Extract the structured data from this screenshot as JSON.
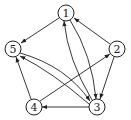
{
  "diagram": {
    "type": "directed-graph",
    "nodes": [
      {
        "id": "1",
        "label": "1",
        "x": 66,
        "y": 13
      },
      {
        "id": "2",
        "label": "2",
        "x": 117,
        "y": 49
      },
      {
        "id": "3",
        "label": "3",
        "x": 97,
        "y": 107
      },
      {
        "id": "4",
        "label": "4",
        "x": 34,
        "y": 107
      },
      {
        "id": "5",
        "label": "5",
        "x": 13,
        "y": 49
      }
    ],
    "edges": [
      {
        "from": "1",
        "to": "5"
      },
      {
        "from": "2",
        "to": "1"
      },
      {
        "from": "2",
        "to": "3"
      },
      {
        "from": "3",
        "to": "1"
      },
      {
        "from": "1",
        "to": "3"
      },
      {
        "from": "3",
        "to": "4"
      },
      {
        "from": "4",
        "to": "5"
      },
      {
        "from": "4",
        "to": "2"
      },
      {
        "from": "5",
        "to": "3"
      },
      {
        "from": "3",
        "to": "5"
      }
    ]
  }
}
